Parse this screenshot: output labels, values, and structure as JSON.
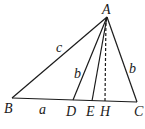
{
  "diagram": {
    "points": {
      "A": {
        "label": "A"
      },
      "B": {
        "label": "B"
      },
      "C": {
        "label": "C"
      },
      "D": {
        "label": "D"
      },
      "E": {
        "label": "E"
      },
      "H": {
        "label": "H"
      }
    },
    "segment_labels": {
      "AB": "c",
      "BD": "a",
      "AD": "b",
      "AC": "b"
    },
    "colors": {
      "stroke": "#1a1a1a",
      "background": "#ffffff"
    }
  }
}
